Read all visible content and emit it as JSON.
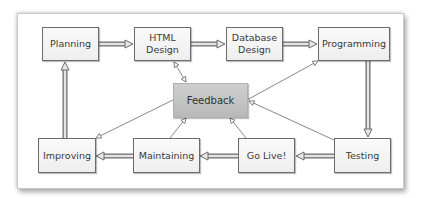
{
  "diagram": {
    "type": "process-flow",
    "title": "",
    "nodes": [
      {
        "id": "planning",
        "label": "Planning"
      },
      {
        "id": "html_design",
        "label": "HTML\nDesign"
      },
      {
        "id": "database_design",
        "label": "Database\nDesign"
      },
      {
        "id": "programming",
        "label": "Programming"
      },
      {
        "id": "feedback",
        "label": "Feedback"
      },
      {
        "id": "improving",
        "label": "Improving"
      },
      {
        "id": "maintaining",
        "label": "Maintaining"
      },
      {
        "id": "go_live",
        "label": "Go Live!"
      },
      {
        "id": "testing",
        "label": "Testing"
      }
    ],
    "edges": [
      {
        "from": "planning",
        "to": "html_design",
        "style": "thick"
      },
      {
        "from": "html_design",
        "to": "database_design",
        "style": "thick"
      },
      {
        "from": "database_design",
        "to": "programming",
        "style": "thick"
      },
      {
        "from": "programming",
        "to": "testing",
        "style": "thick"
      },
      {
        "from": "testing",
        "to": "go_live",
        "style": "thick"
      },
      {
        "from": "go_live",
        "to": "maintaining",
        "style": "thick"
      },
      {
        "from": "maintaining",
        "to": "improving",
        "style": "thick"
      },
      {
        "from": "improving",
        "to": "planning",
        "style": "thick"
      },
      {
        "from": "feedback",
        "to": "html_design",
        "style": "thin",
        "bidirectional": true
      },
      {
        "from": "feedback",
        "to": "programming",
        "style": "thin"
      },
      {
        "from": "feedback",
        "to": "improving",
        "style": "thin"
      },
      {
        "from": "maintaining",
        "to": "feedback",
        "style": "thin"
      },
      {
        "from": "go_live",
        "to": "feedback",
        "style": "thin"
      },
      {
        "from": "testing",
        "to": "feedback",
        "style": "thin"
      }
    ]
  },
  "colors": {
    "node_fill": "#f2f2f2",
    "node_border": "#6b6b6b",
    "feedback_fill": "#c4c4c4",
    "arrow": "#707070"
  }
}
